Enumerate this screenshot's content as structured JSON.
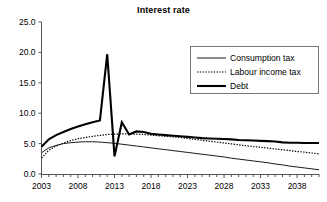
{
  "chart_data": {
    "type": "line",
    "title": "Interest rate",
    "xlabel": "",
    "ylabel": "",
    "xlim": [
      2003,
      2041
    ],
    "ylim": [
      0.0,
      25.0
    ],
    "grid": false,
    "legend_position": "top-right",
    "y_ticks": [
      "0.0",
      "5.0",
      "10.0",
      "15.0",
      "20.0",
      "25.0"
    ],
    "y_tick_values": [
      0.0,
      5.0,
      10.0,
      15.0,
      20.0,
      25.0
    ],
    "x_ticks": [
      "2003",
      "2008",
      "2013",
      "2018",
      "2023",
      "2028",
      "2033",
      "2038"
    ],
    "x_tick_values": [
      2003,
      2008,
      2013,
      2018,
      2023,
      2028,
      2033,
      2038
    ],
    "x_minor_tick_step": 1,
    "x": [
      2003,
      2004,
      2005,
      2006,
      2007,
      2008,
      2009,
      2010,
      2011,
      2012,
      2013,
      2014,
      2015,
      2016,
      2017,
      2018,
      2019,
      2020,
      2021,
      2022,
      2023,
      2024,
      2025,
      2026,
      2027,
      2028,
      2029,
      2030,
      2031,
      2032,
      2033,
      2034,
      2035,
      2036,
      2037,
      2038,
      2039,
      2040,
      2041
    ],
    "series": [
      {
        "name": "Consumption tax",
        "style": "solid-thin",
        "color": "#000000",
        "values": [
          3.5,
          4.3,
          4.7,
          5.0,
          5.15,
          5.25,
          5.3,
          5.3,
          5.25,
          5.15,
          5.05,
          4.9,
          4.75,
          4.6,
          4.45,
          4.3,
          4.15,
          4.0,
          3.85,
          3.7,
          3.55,
          3.4,
          3.25,
          3.1,
          2.95,
          2.8,
          2.6,
          2.45,
          2.3,
          2.15,
          2.0,
          1.85,
          1.65,
          1.5,
          1.3,
          1.15,
          1.0,
          0.85,
          0.7
        ]
      },
      {
        "name": "Labour income tax",
        "style": "dotted",
        "color": "#000000",
        "values": [
          2.6,
          3.9,
          4.6,
          5.1,
          5.5,
          5.8,
          6.0,
          6.2,
          6.35,
          6.5,
          6.55,
          6.6,
          6.6,
          6.55,
          6.5,
          6.4,
          6.3,
          6.2,
          6.1,
          6.0,
          5.85,
          5.7,
          5.55,
          5.4,
          5.25,
          5.1,
          4.95,
          4.8,
          4.65,
          4.5,
          4.4,
          4.25,
          4.1,
          4.0,
          3.85,
          3.7,
          3.6,
          3.45,
          3.3
        ]
      },
      {
        "name": "Debt",
        "style": "solid-thick",
        "color": "#000000",
        "values": [
          4.5,
          5.7,
          6.4,
          6.9,
          7.4,
          7.8,
          8.2,
          8.5,
          8.8,
          19.7,
          2.9,
          8.5,
          6.5,
          7.0,
          6.9,
          6.6,
          6.5,
          6.4,
          6.3,
          6.2,
          6.1,
          6.0,
          5.9,
          5.85,
          5.8,
          5.75,
          5.7,
          5.6,
          5.55,
          5.5,
          5.45,
          5.4,
          5.35,
          5.2,
          5.15,
          5.15,
          5.1,
          5.1,
          5.1
        ]
      }
    ],
    "annotations": {
      "debt_peak_year": 2012,
      "debt_peak_value": 19.7,
      "debt_trough_year": 2013,
      "debt_trough_value": 2.9
    }
  },
  "legend": {
    "entries": [
      {
        "label": "Consumption tax"
      },
      {
        "label": "Labour income tax"
      },
      {
        "label": "Debt"
      }
    ]
  }
}
